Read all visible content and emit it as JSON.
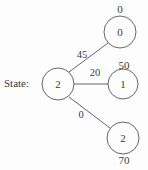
{
  "figure": {
    "state_label": "State:",
    "root": {
      "id": "root",
      "value": "2",
      "cx": 58,
      "cy": 84,
      "r": 16
    },
    "children": [
      {
        "id": "child-0",
        "value": "0",
        "reward": "0",
        "reward_pos": "above",
        "cx": 120,
        "cy": 32,
        "r": 16,
        "weight": "45",
        "weight_x": 82,
        "weight_y": 55
      },
      {
        "id": "child-1",
        "value": "1",
        "reward": "50",
        "reward_pos": "above",
        "cx": 123,
        "cy": 84,
        "r": 15,
        "weight": "20",
        "weight_x": 95,
        "weight_y": 73
      },
      {
        "id": "child-2",
        "value": "2",
        "reward": "70",
        "reward_pos": "below",
        "cx": 123,
        "cy": 138,
        "r": 16,
        "weight": "0",
        "weight_x": 81,
        "weight_y": 115
      }
    ],
    "colors": {
      "stroke": "#55555a",
      "text": "#3a3a3e",
      "background": "#fdfdfd"
    }
  }
}
